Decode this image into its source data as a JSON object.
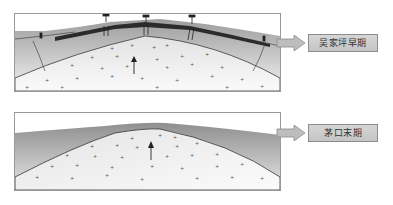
{
  "panels": [
    {
      "id": "top",
      "label": "吴家坪早期",
      "features": [
        "surface-structures",
        "uplift-arrow",
        "dome",
        "faults",
        "dark-cap-layer"
      ]
    },
    {
      "id": "bottom",
      "label": "茅口末期",
      "features": [
        "uplift-arrow",
        "dome",
        "gray-cover-layer"
      ]
    }
  ],
  "colors": {
    "frame": "#9a9a9a",
    "dome_fill": "#e6e6e6",
    "cover_fill": "#a8a8a8",
    "cap_layer": "#2b2b2b",
    "arrow_fill": "#bdbdbd",
    "label_bg": "#cccccc"
  }
}
